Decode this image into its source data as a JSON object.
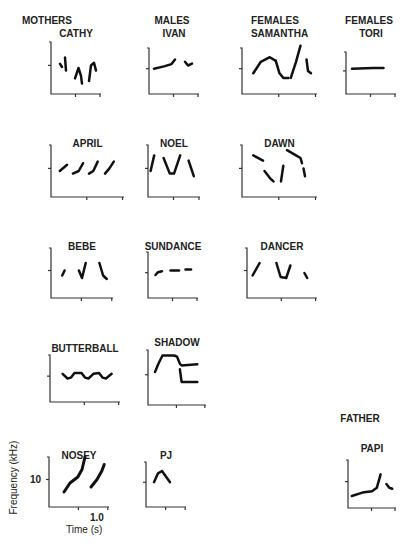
{
  "chart_data": {
    "type": "line",
    "title": "",
    "xlabel": "Time (s)",
    "ylabel": "Frequency (kHz)",
    "x_tick_label": "1.0",
    "y_tick_label": "10",
    "groups": [
      {
        "name": "MOTHERS"
      },
      {
        "name": "MALES"
      },
      {
        "name": "FEMALES"
      },
      {
        "name": "FEMALES"
      },
      {
        "name": "FATHER"
      }
    ],
    "panels": [
      {
        "id": "cathy",
        "name": "CATHY",
        "group": "MOTHERS",
        "strokes": [
          [
            [
              0.18,
              0.58
            ],
            [
              0.22,
              0.52
            ]
          ],
          [
            [
              0.28,
              0.7
            ],
            [
              0.3,
              0.45
            ]
          ],
          [
            [
              0.48,
              0.3
            ],
            [
              0.55,
              0.5
            ],
            [
              0.6,
              0.35
            ],
            [
              0.62,
              0.2
            ]
          ],
          [
            [
              0.76,
              0.25
            ],
            [
              0.8,
              0.55
            ],
            [
              0.86,
              0.6
            ],
            [
              0.9,
              0.45
            ]
          ]
        ]
      },
      {
        "id": "ivan",
        "name": "IVAN",
        "group": "MALES",
        "strokes": [
          [
            [
              0.1,
              0.55
            ],
            [
              0.3,
              0.6
            ],
            [
              0.45,
              0.65
            ],
            [
              0.52,
              0.75
            ]
          ],
          [
            [
              0.72,
              0.7
            ],
            [
              0.78,
              0.62
            ],
            [
              0.86,
              0.66
            ]
          ]
        ]
      },
      {
        "id": "samantha",
        "name": "SAMANTHA",
        "group": "FEMALES",
        "strokes": [
          [
            [
              0.15,
              0.45
            ],
            [
              0.25,
              0.7
            ],
            [
              0.37,
              0.8
            ],
            [
              0.45,
              0.72
            ]
          ],
          [
            [
              0.45,
              0.72
            ],
            [
              0.5,
              0.45
            ],
            [
              0.55,
              0.35
            ],
            [
              0.62,
              0.35
            ]
          ],
          [
            [
              0.65,
              0.35
            ],
            [
              0.72,
              0.7
            ],
            [
              0.78,
              1.05
            ]
          ],
          [
            [
              0.86,
              0.75
            ],
            [
              0.88,
              0.5
            ],
            [
              0.92,
              0.45
            ]
          ]
        ]
      },
      {
        "id": "tori",
        "name": "TORI",
        "group": "FEMALES",
        "strokes": [
          [
            [
              0.12,
              0.6
            ],
            [
              0.55,
              0.62
            ],
            [
              0.75,
              0.62
            ]
          ]
        ]
      },
      {
        "id": "april",
        "name": "APRIL",
        "group": "",
        "strokes": [
          [
            [
              0.12,
              0.5
            ],
            [
              0.22,
              0.62
            ]
          ],
          [
            [
              0.3,
              0.45
            ],
            [
              0.38,
              0.5
            ],
            [
              0.44,
              0.65
            ]
          ],
          [
            [
              0.52,
              0.45
            ],
            [
              0.58,
              0.5
            ],
            [
              0.64,
              0.68
            ]
          ],
          [
            [
              0.74,
              0.45
            ],
            [
              0.8,
              0.55
            ],
            [
              0.86,
              0.68
            ]
          ]
        ]
      },
      {
        "id": "noel",
        "name": "NOEL",
        "group": "",
        "strokes": [
          [
            [
              0.05,
              0.5
            ],
            [
              0.12,
              0.8
            ]
          ],
          [
            [
              0.3,
              0.75
            ],
            [
              0.42,
              0.45
            ],
            [
              0.5,
              0.45
            ],
            [
              0.62,
              0.8
            ]
          ],
          [
            [
              0.78,
              0.7
            ],
            [
              0.88,
              0.4
            ]
          ]
        ]
      },
      {
        "id": "dawn",
        "name": "DAWN",
        "group": "",
        "strokes": [
          [
            [
              0.15,
              0.8
            ],
            [
              0.28,
              0.7
            ]
          ],
          [
            [
              0.3,
              0.5
            ],
            [
              0.38,
              0.35
            ],
            [
              0.42,
              0.3
            ]
          ],
          [
            [
              0.52,
              0.3
            ],
            [
              0.55,
              0.6
            ]
          ],
          [
            [
              0.6,
              0.9
            ],
            [
              0.72,
              0.8
            ],
            [
              0.78,
              0.75
            ],
            [
              0.8,
              0.65
            ]
          ],
          [
            [
              0.82,
              0.55
            ],
            [
              0.84,
              0.4
            ]
          ]
        ]
      },
      {
        "id": "bebe",
        "name": "BEBE",
        "group": "",
        "strokes": [
          [
            [
              0.18,
              0.45
            ],
            [
              0.22,
              0.55
            ]
          ],
          [
            [
              0.45,
              0.55
            ],
            [
              0.5,
              0.4
            ],
            [
              0.56,
              0.7
            ]
          ],
          [
            [
              0.78,
              0.7
            ],
            [
              0.84,
              0.45
            ],
            [
              0.9,
              0.38
            ]
          ]
        ]
      },
      {
        "id": "sundance",
        "name": "SUNDANCE",
        "group": "",
        "strokes": [
          [
            [
              0.15,
              0.5
            ],
            [
              0.2,
              0.56
            ],
            [
              0.28,
              0.58
            ]
          ],
          [
            [
              0.45,
              0.6
            ],
            [
              0.62,
              0.6
            ]
          ],
          [
            [
              0.75,
              0.62
            ],
            [
              0.86,
              0.62
            ]
          ]
        ]
      },
      {
        "id": "dancer",
        "name": "DANCER",
        "group": "",
        "strokes": [
          [
            [
              0.08,
              0.45
            ],
            [
              0.18,
              0.7
            ]
          ],
          [
            [
              0.42,
              0.7
            ],
            [
              0.48,
              0.42
            ],
            [
              0.56,
              0.4
            ],
            [
              0.62,
              0.65
            ]
          ],
          [
            [
              0.82,
              0.5
            ],
            [
              0.86,
              0.4
            ]
          ]
        ]
      },
      {
        "id": "butterball",
        "name": "BUTTERBALL",
        "group": "",
        "strokes": [
          [
            [
              0.18,
              0.6
            ],
            [
              0.25,
              0.5
            ],
            [
              0.3,
              0.52
            ],
            [
              0.35,
              0.62
            ],
            [
              0.45,
              0.62
            ],
            [
              0.5,
              0.52
            ],
            [
              0.55,
              0.5
            ],
            [
              0.62,
              0.6
            ],
            [
              0.7,
              0.62
            ],
            [
              0.75,
              0.52
            ],
            [
              0.8,
              0.5
            ],
            [
              0.88,
              0.6
            ]
          ]
        ]
      },
      {
        "id": "shadow",
        "name": "SHADOW",
        "group": "",
        "strokes": [
          [
            [
              0.12,
              0.6
            ],
            [
              0.18,
              0.75
            ],
            [
              0.25,
              0.9
            ],
            [
              0.45,
              0.9
            ],
            [
              0.5,
              0.88
            ],
            [
              0.55,
              0.75
            ],
            [
              0.58,
              0.72
            ],
            [
              0.85,
              0.74
            ]
          ],
          [
            [
              0.55,
              0.65
            ],
            [
              0.58,
              0.42
            ],
            [
              0.85,
              0.42
            ]
          ]
        ]
      },
      {
        "id": "nosey",
        "name": "NOSEY",
        "group": "",
        "strokes": [
          [
            [
              0.25,
              0.3
            ],
            [
              0.35,
              0.48
            ],
            [
              0.48,
              0.6
            ],
            [
              0.55,
              0.75
            ],
            [
              0.6,
              1.0
            ]
          ],
          [
            [
              0.7,
              0.4
            ],
            [
              0.8,
              0.55
            ],
            [
              0.88,
              0.72
            ],
            [
              0.92,
              0.85
            ]
          ]
        ]
      },
      {
        "id": "pj",
        "name": "PJ",
        "group": "",
        "strokes": [
          [
            [
              0.2,
              0.55
            ],
            [
              0.3,
              0.75
            ],
            [
              0.4,
              0.8
            ],
            [
              0.52,
              0.65
            ],
            [
              0.6,
              0.55
            ]
          ]
        ]
      },
      {
        "id": "papi",
        "name": "PAPI",
        "group": "FATHER",
        "strokes": [
          [
            [
              0.08,
              0.25
            ],
            [
              0.3,
              0.32
            ],
            [
              0.5,
              0.35
            ],
            [
              0.6,
              0.42
            ],
            [
              0.68,
              0.7
            ]
          ],
          [
            [
              0.8,
              0.5
            ],
            [
              0.86,
              0.42
            ],
            [
              0.92,
              0.4
            ]
          ]
        ]
      }
    ]
  }
}
